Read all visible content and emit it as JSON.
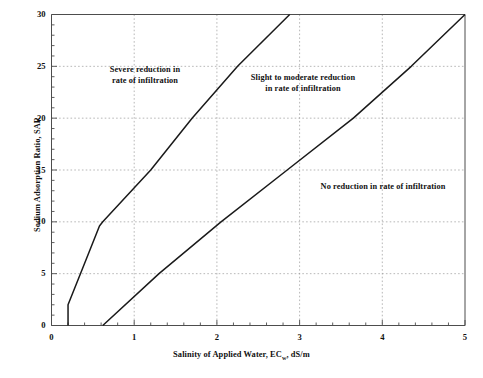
{
  "chart_data": {
    "type": "line",
    "title": "",
    "xlabel": "Salinity of Applied Water, EC",
    "xlabel_sub": "w",
    "xlabel_tail": ", dS/m",
    "ylabel": "Sodium Adsorption Ratio, SAR",
    "xlim": [
      0,
      5
    ],
    "ylim": [
      0,
      30
    ],
    "xticks": [
      0,
      1,
      2,
      3,
      4,
      5
    ],
    "yticks": [
      0,
      5,
      10,
      15,
      20,
      25,
      30
    ],
    "x_minor_step": 0.2,
    "y_minor_step": 1,
    "grid": "dashed gridlines at major ticks",
    "legend": "none",
    "line_color": "#1a1a1a",
    "grid_color": "#9a9a9a",
    "axis_color": "#4d4d4d",
    "series": [
      {
        "name": "severe / slight-to-moderate boundary",
        "points": [
          {
            "x": 0.2,
            "y": 0
          },
          {
            "x": 0.2,
            "y": 2.0
          },
          {
            "x": 0.35,
            "y": 5.0
          },
          {
            "x": 0.45,
            "y": 7.0
          },
          {
            "x": 0.58,
            "y": 9.6
          },
          {
            "x": 0.62,
            "y": 10.0
          },
          {
            "x": 1.2,
            "y": 15.0
          },
          {
            "x": 1.7,
            "y": 20.0
          },
          {
            "x": 2.25,
            "y": 25.0
          },
          {
            "x": 2.88,
            "y": 30.0
          }
        ]
      },
      {
        "name": "slight-to-moderate / no reduction boundary",
        "points": [
          {
            "x": 0.62,
            "y": 0
          },
          {
            "x": 1.3,
            "y": 5.0
          },
          {
            "x": 2.05,
            "y": 10.0
          },
          {
            "x": 2.85,
            "y": 15.0
          },
          {
            "x": 3.65,
            "y": 20.0
          },
          {
            "x": 4.35,
            "y": 25.0
          },
          {
            "x": 5.0,
            "y": 30.0
          }
        ]
      }
    ],
    "annotations": [
      {
        "id": "severe",
        "text": "Severe reduction in\nrate of infiltration",
        "x": 0.95,
        "y": 24.0
      },
      {
        "id": "slight",
        "text": "Slight to moderate reduction\nin rate of infiltration",
        "x": 2.45,
        "y": 23.5
      },
      {
        "id": "none",
        "text": "No reduction in rate of infiltration",
        "x": 3.65,
        "y": 14.3
      }
    ]
  }
}
